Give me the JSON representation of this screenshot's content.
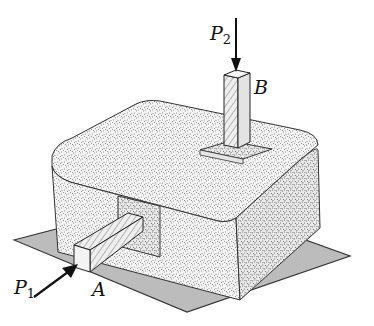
{
  "diagram": {
    "labels": {
      "p1": {
        "letter": "P",
        "sub": "1"
      },
      "p2": {
        "letter": "P",
        "sub": "2"
      },
      "a": "A",
      "b": "B"
    },
    "colors": {
      "base_plate": "#b9b9b9",
      "concrete": "#f2f2f2",
      "speckle": "#555555",
      "outline": "#222222",
      "post_side": "#e0e0e0"
    }
  }
}
